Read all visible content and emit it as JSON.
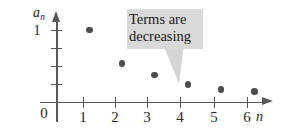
{
  "figure": {
    "type": "scatter-plot",
    "annotation": {
      "text": "Terms are\ndecreasing",
      "box_color": "#d9d9d9",
      "tail_color": "#d5d5d5"
    },
    "axes": {
      "y_title": "a",
      "y_subscript": "n",
      "x_title": "n",
      "origin_label": "0",
      "y_tick_label": "1",
      "x_tick_labels": [
        "1",
        "2",
        "3",
        "4",
        "5",
        "6"
      ]
    },
    "colors": {
      "axis": "#58585a",
      "point": "#4d4d4f",
      "text": "#2b2b2b"
    }
  },
  "chart_data": {
    "type": "scatter",
    "title": "",
    "xlabel": "n",
    "ylabel": "a_n",
    "x": [
      1,
      2,
      3,
      4,
      5,
      6
    ],
    "values": [
      1.0,
      0.54,
      0.375,
      0.25,
      0.18,
      0.15
    ],
    "xlim": [
      0,
      6.8
    ],
    "ylim": [
      0,
      1.22
    ],
    "xticks": [
      1,
      2,
      3,
      4,
      5,
      6
    ],
    "xticklabels": [
      "1",
      "2",
      "3",
      "4",
      "5",
      "6"
    ],
    "yticks": [
      0.25,
      0.5,
      0.75,
      1.0
    ],
    "yticklabels": [
      "",
      "",
      "",
      "1"
    ],
    "grid": false,
    "legend": false,
    "annotations": [
      {
        "text": "Terms are decreasing",
        "points_to_x": 4,
        "points_to_y": 0.25
      }
    ],
    "series": [
      {
        "name": "a_n",
        "points": [
          {
            "n": 1,
            "a": 1.0
          },
          {
            "n": 2,
            "a": 0.54
          },
          {
            "n": 3,
            "a": 0.375
          },
          {
            "n": 4,
            "a": 0.25
          },
          {
            "n": 5,
            "a": 0.18
          },
          {
            "n": 6,
            "a": 0.15
          }
        ]
      }
    ]
  }
}
